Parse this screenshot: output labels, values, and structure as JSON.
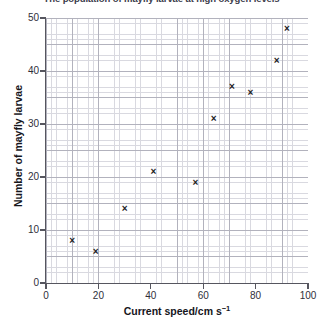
{
  "chart_data": {
    "type": "scatter",
    "title": "The population of mayfly larvae at high oxygen levels",
    "xlabel": "Current speed/cm s",
    "xlabel_exponent": "−1",
    "ylabel": "Number of mayfly larvae",
    "xlim": [
      0,
      100
    ],
    "ylim": [
      0,
      50
    ],
    "xticks": [
      0,
      20,
      40,
      60,
      80,
      100
    ],
    "yticks": [
      0,
      10,
      20,
      30,
      40,
      50
    ],
    "grid": true,
    "minor_grid": true,
    "legend": "none",
    "marker": "x",
    "marker_color": "#1c1c24",
    "x": [
      10,
      19,
      30,
      41,
      57,
      64,
      71,
      78,
      88,
      92
    ],
    "y": [
      8,
      6,
      14,
      21,
      19,
      31,
      37,
      36,
      42,
      48
    ],
    "points": [
      {
        "x": 10,
        "y": 8
      },
      {
        "x": 19,
        "y": 6
      },
      {
        "x": 30,
        "y": 14
      },
      {
        "x": 41,
        "y": 21
      },
      {
        "x": 57,
        "y": 19
      },
      {
        "x": 64,
        "y": 31
      },
      {
        "x": 71,
        "y": 37
      },
      {
        "x": 78,
        "y": 36
      },
      {
        "x": 88,
        "y": 42
      },
      {
        "x": 92,
        "y": 48
      }
    ],
    "marker_glyph": "×"
  },
  "axis_colors": {
    "spine": "#56565f",
    "major_grid": "#b2b2bd",
    "minor_grid": "#d9d9e0",
    "text": "#16161c"
  }
}
